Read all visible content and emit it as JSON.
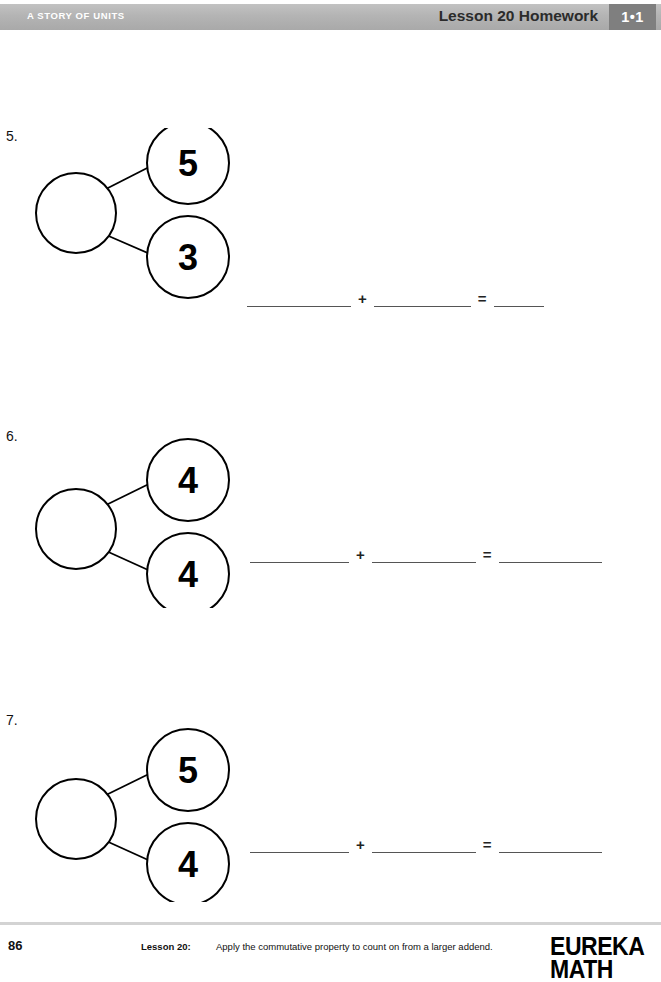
{
  "header": {
    "left_title": "A STORY OF UNITS",
    "right_title": "Lesson 20 Homework",
    "badge": "1•1",
    "band_color": "#b4b4b4",
    "badge_color": "#7f7f7f"
  },
  "problems": [
    {
      "number": "5.",
      "whole": "",
      "part_top": "5",
      "part_bottom": "3",
      "equation": {
        "plus": "+",
        "equals": "=",
        "blank1": "",
        "blank2": "",
        "blank3": ""
      }
    },
    {
      "number": "6.",
      "whole": "",
      "part_top": "4",
      "part_bottom": "4",
      "equation": {
        "plus": "+",
        "equals": "=",
        "blank1": "",
        "blank2": "",
        "blank3": ""
      }
    },
    {
      "number": "7.",
      "whole": "",
      "part_top": "5",
      "part_bottom": "4",
      "equation": {
        "plus": "+",
        "equals": "=",
        "blank1": "",
        "blank2": "",
        "blank3": ""
      }
    }
  ],
  "footer": {
    "page_number": "86",
    "lesson_label": "Lesson 20:",
    "lesson_description": "Apply the commutative property to count on from a larger addend.",
    "copyright": "",
    "logo_line1": "EUREKA",
    "logo_line2": "MATH"
  }
}
